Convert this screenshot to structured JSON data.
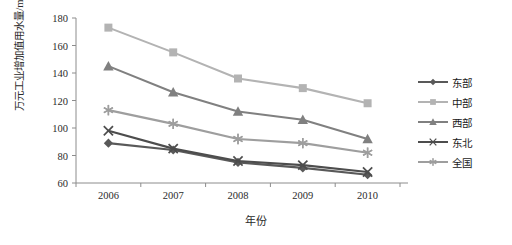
{
  "chart_data": {
    "type": "line",
    "title": "",
    "xlabel": "年份",
    "ylabel": "万元工业增加值用水量/m³",
    "categories": [
      "2006",
      "2007",
      "2008",
      "2009",
      "2010"
    ],
    "x": [
      2006,
      2007,
      2008,
      2009,
      2010
    ],
    "ylim": [
      60,
      180
    ],
    "yticks": [
      60,
      80,
      100,
      120,
      140,
      160,
      180
    ],
    "grid": false,
    "legend_position": "right",
    "series": [
      {
        "name": "东部",
        "color": "#595959",
        "marker": "diamond",
        "values": [
          89,
          84,
          75,
          71,
          66
        ]
      },
      {
        "name": "中部",
        "color": "#b3b3b3",
        "marker": "square",
        "values": [
          173,
          155,
          136,
          129,
          118
        ]
      },
      {
        "name": "西部",
        "color": "#808080",
        "marker": "triangle",
        "values": [
          145,
          126,
          112,
          106,
          92
        ]
      },
      {
        "name": "东北",
        "color": "#4d4d4d",
        "marker": "x",
        "values": [
          98,
          85,
          76,
          73,
          68
        ]
      },
      {
        "name": "全国",
        "color": "#9e9e9e",
        "marker": "asterisk",
        "values": [
          113,
          103,
          92,
          89,
          82
        ]
      }
    ]
  },
  "axis": {
    "ytick_labels": [
      "180",
      "160",
      "140",
      "120",
      "100",
      "80",
      "60"
    ],
    "xtick_labels": [
      "2006",
      "2007",
      "2008",
      "2009",
      "2010"
    ],
    "y_title": "万元工业增加值用水量/m³",
    "x_title": "年份"
  },
  "legend": {
    "items": [
      {
        "label": "东部"
      },
      {
        "label": "中部"
      },
      {
        "label": "西部"
      },
      {
        "label": "东北"
      },
      {
        "label": "全国"
      }
    ]
  },
  "colors": {
    "axis": "#8c8c8c",
    "text": "#2b2b2b",
    "background": "#ffffff"
  }
}
